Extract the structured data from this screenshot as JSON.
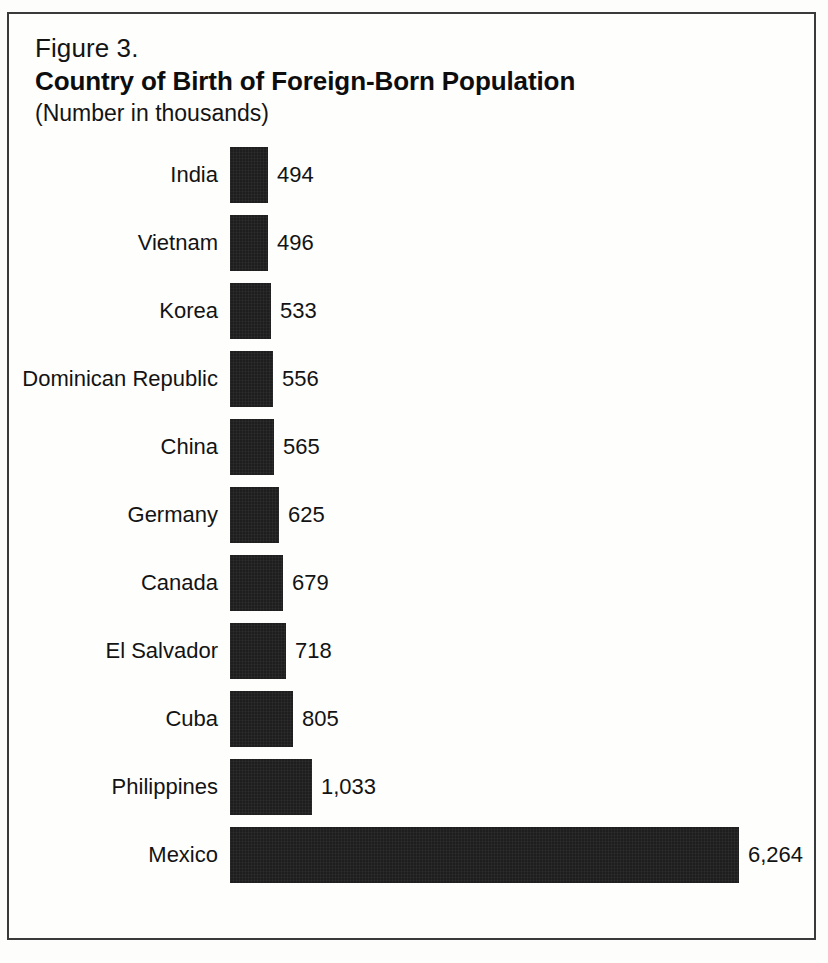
{
  "figure": {
    "number": "Figure 3.",
    "title": "Country of Birth of Foreign-Born Population",
    "subtitle": "(Number in thousands)"
  },
  "chart_data": {
    "type": "bar",
    "orientation": "horizontal",
    "title": "Country of Birth of Foreign-Born Population",
    "subtitle": "(Number in thousands)",
    "figure_number": "Figure 3.",
    "xlabel": "",
    "ylabel": "",
    "units": "thousands",
    "grid": false,
    "legend": false,
    "axis_visible": false,
    "value_labels": true,
    "xlim": [
      0,
      6264
    ],
    "bar_color": "#1e1e1e",
    "background_color": "#fefefd",
    "categories": [
      "India",
      "Vietnam",
      "Korea",
      "Dominican Republic",
      "China",
      "Germany",
      "Canada",
      "El Salvador",
      "Cuba",
      "Philippines",
      "Mexico"
    ],
    "values": [
      494,
      496,
      533,
      556,
      565,
      625,
      679,
      718,
      805,
      1033,
      6264
    ],
    "value_labels_text": [
      "494",
      "496",
      "533",
      "556",
      "565",
      "625",
      "679",
      "718",
      "805",
      "1,033",
      "6,264"
    ]
  }
}
